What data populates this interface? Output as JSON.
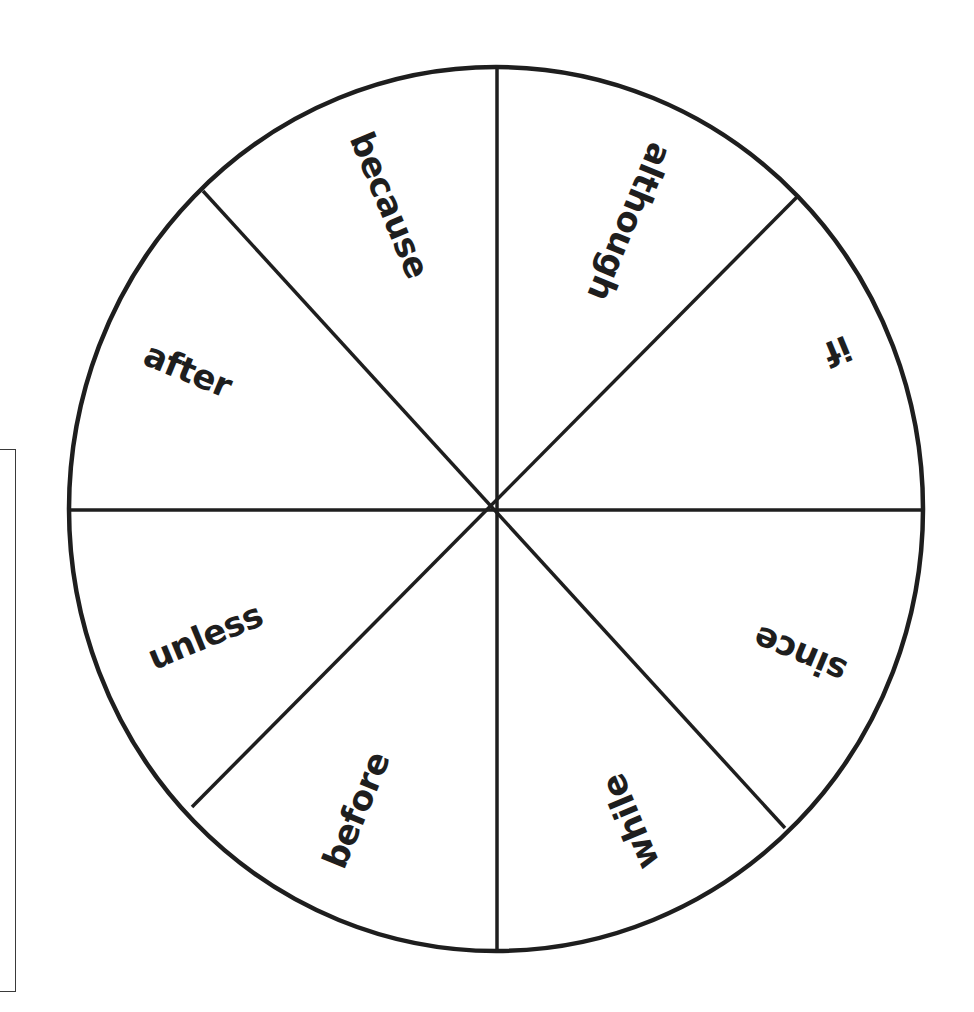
{
  "diagram": {
    "type": "word-wheel",
    "segments": 8,
    "colors": {
      "stroke": "#1e1e1e",
      "background": "#ffffff",
      "text": "#1e1e1e"
    },
    "wedges": [
      {
        "label": "because"
      },
      {
        "label": "although"
      },
      {
        "label": "if"
      },
      {
        "label": "since"
      },
      {
        "label": "while"
      },
      {
        "label": "before"
      },
      {
        "label": "unless"
      },
      {
        "label": "after"
      }
    ]
  }
}
